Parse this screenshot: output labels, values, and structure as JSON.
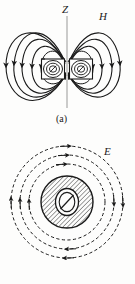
{
  "page": {
    "background_color": "#fdfdfc",
    "ink_color": "#1a1a1a",
    "width": 135,
    "height": 284
  },
  "figures": [
    {
      "id": "a",
      "caption": "(a)",
      "title": "Magnetic field H of a current loop",
      "labels": {
        "axis": "Z",
        "field": "H"
      },
      "axis": {
        "name": "Z",
        "orientation": "vertical",
        "x": 67,
        "y_top": 16,
        "y_bottom": 108,
        "style": "thin solid line"
      },
      "coil": {
        "shape": "two rectangular coil cross-sections with concentric ellipses",
        "center_x": 67,
        "center_y": 69,
        "left_box": {
          "x": 41,
          "y": 59,
          "w": 24,
          "h": 20
        },
        "right_box": {
          "x": 69,
          "y": 59,
          "w": 24,
          "h": 20
        },
        "hatched": true
      },
      "field_lines": {
        "style": "solid with arrowheads",
        "count": 8,
        "description": "dipole loops emanating from coil, four per side, up-and-over topology",
        "arrow_direction": "out of top, around, into bottom"
      }
    },
    {
      "id": "b",
      "caption": "(b)",
      "title": "Induced electric field E around a changing flux region",
      "labels": {
        "field": "E"
      },
      "core": {
        "shape": "hatched disk with inner ellipse and diagonal slash",
        "center_x": 67,
        "center_y": 202,
        "outer_radius": 26,
        "inner_ellipse_rx": 11,
        "inner_ellipse_ry": 13,
        "hatched": true,
        "hatch_angle_deg": 45
      },
      "field_lines": {
        "style": "dashed circles with arrowheads",
        "count": 3,
        "radii": [
          38,
          47,
          56
        ],
        "arrow_direction": "clockwise"
      }
    }
  ]
}
